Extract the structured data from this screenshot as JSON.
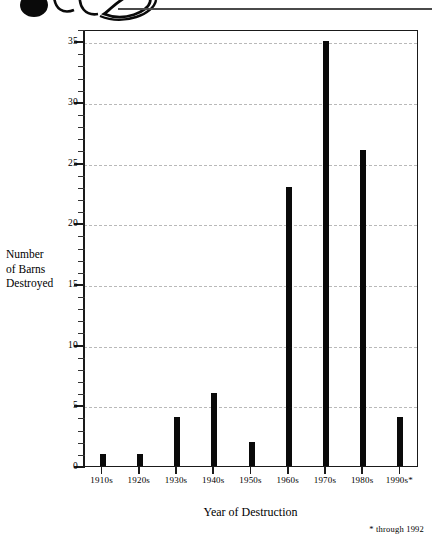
{
  "ornament": {
    "name": "decorative-flourish",
    "rule_color": "#4a4a4a"
  },
  "chart_data": {
    "type": "bar",
    "title": "",
    "subtitle": "",
    "xlabel": "Year of Destruction",
    "ylabel": "Number\nof Barns\nDestroyed",
    "categories": [
      "1910s",
      "1920s",
      "1930s",
      "1940s",
      "1950s",
      "1960s",
      "1970s",
      "1980s",
      "1990s*"
    ],
    "values": [
      1,
      1,
      4,
      6,
      2,
      23,
      35,
      26,
      4
    ],
    "ylim": [
      0,
      36
    ],
    "ytick_major": [
      0,
      5,
      10,
      15,
      20,
      25,
      30,
      35
    ],
    "ytick_major_labels": [
      "0",
      "5",
      "10",
      "15",
      "20",
      "25",
      "30",
      "35"
    ],
    "ytick_minor_step": 1,
    "grid": true,
    "grid_axis": "y",
    "grid_style": "dashed",
    "grid_color": "#b9b9b9",
    "bar_color": "#0a0a0a",
    "frame_color": "#1a1a1a",
    "legend": null,
    "annotations": [
      {
        "name": "footnote",
        "text": "* through 1992"
      }
    ]
  }
}
